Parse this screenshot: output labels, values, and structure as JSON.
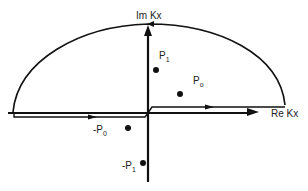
{
  "diagram": {
    "axes": {
      "imag_label": "Im Kx",
      "real_label": "Re Kx"
    },
    "poles": [
      {
        "id": "p1",
        "label_main": "P",
        "label_sub": "1",
        "x": 156,
        "y": 70
      },
      {
        "id": "p0",
        "label_main": "P",
        "label_sub": "o",
        "x": 180,
        "y": 94
      },
      {
        "id": "neg-p0",
        "label_main": "-P",
        "label_sub": "0",
        "x": 128,
        "y": 128
      },
      {
        "id": "neg-p1",
        "label_main": "-P",
        "label_sub": "1",
        "x": 143,
        "y": 163
      }
    ],
    "colors": {
      "stroke": "#111111",
      "background": "#ffffff"
    }
  }
}
